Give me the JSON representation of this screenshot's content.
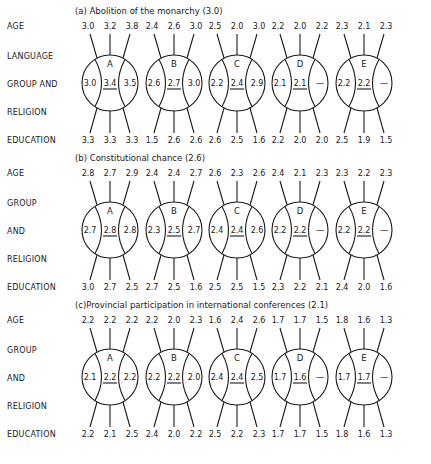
{
  "figure": {
    "row_labels": [
      "AGE",
      "LANGUAGE GROUP AND RELIGION",
      "EDUCATION"
    ],
    "panels": [
      {
        "title": "(a) Abolition of the monarchy (3.0)",
        "side_labels": [
          "AGE",
          "LANGUAGE",
          "GROUP  AND",
          "RELIGION",
          "EDUCATION"
        ],
        "groups": [
          {
            "name": "A",
            "age": [
              "3.0",
              "3.2",
              "3.8"
            ],
            "left": "3.0",
            "center": "3.4",
            "right": "3.5",
            "education": [
              "3.3",
              "3.3",
              "3.3"
            ]
          },
          {
            "name": "B",
            "age": [
              "2.4",
              "2.6",
              "3.0"
            ],
            "left": "2.6",
            "center": "2.7",
            "right": "3.0",
            "education": [
              "1.5",
              "2.6",
              "2.6"
            ]
          },
          {
            "name": "C",
            "age": [
              "2.5",
              "2.0",
              "3.0"
            ],
            "left": "2.2",
            "center": "2.4",
            "right": "2.9",
            "education": [
              "2.6",
              "2.5",
              "1.6"
            ]
          },
          {
            "name": "D",
            "age": [
              "2.2",
              "2.0",
              "2.2"
            ],
            "left": "2.1",
            "center": "2.1",
            "right": "—",
            "education": [
              "2.2",
              "2.0",
              "2.0"
            ]
          },
          {
            "name": "E",
            "age": [
              "2.3",
              "2.1",
              "2.3"
            ],
            "left": "2.2",
            "center": "2.2",
            "right": "—",
            "education": [
              "2.5",
              "1.9",
              "1.5"
            ]
          }
        ]
      },
      {
        "title": "(b) Constitutional chance (2.6)",
        "side_labels": [
          "AGE",
          "GROUP",
          "AND",
          "RELIGION",
          "EDUCATION"
        ],
        "groups": [
          {
            "name": "A",
            "age": [
              "2.8",
              "2.7",
              "2.9"
            ],
            "left": "2.7",
            "center": "2.8",
            "right": "2.8",
            "education": [
              "3.0",
              "2.7",
              "2.5"
            ]
          },
          {
            "name": "B",
            "age": [
              "2.4",
              "2.4",
              "2.7"
            ],
            "left": "2.3",
            "center": "2.5",
            "right": "2.7",
            "education": [
              "2.7",
              "2.5",
              "1.6"
            ]
          },
          {
            "name": "C",
            "age": [
              "2.6",
              "2.3",
              "2.6"
            ],
            "left": "2.4",
            "center": "2.4",
            "right": "2.6",
            "education": [
              "2.5",
              "2.5",
              "1.5"
            ]
          },
          {
            "name": "D",
            "age": [
              "2.4",
              "2.1",
              "2.3"
            ],
            "left": "2.2",
            "center": "2.2",
            "right": "—",
            "education": [
              "2.3",
              "2.2",
              "2.1"
            ]
          },
          {
            "name": "E",
            "age": [
              "2.3",
              "2.2",
              "2.3"
            ],
            "left": "2.2",
            "center": "2.2",
            "right": "—",
            "education": [
              "2.4",
              "2.0",
              "1.6"
            ]
          }
        ]
      },
      {
        "title": "(c)Provincial participation in international conferences (2.1)",
        "side_labels": [
          "AGE",
          "GROUP",
          "AND",
          "RELIGION",
          "EDUCATION"
        ],
        "groups": [
          {
            "name": "A",
            "age": [
              "2.2",
              "2.2",
              "2.2"
            ],
            "left": "2.1",
            "center": "2.2",
            "right": "2.2",
            "education": [
              "2.2",
              "2.1",
              "2.5"
            ]
          },
          {
            "name": "B",
            "age": [
              "2.2",
              "2.0",
              "2.3"
            ],
            "left": "2.2",
            "center": "2.2",
            "right": "2.0",
            "education": [
              "2.4",
              "2.0",
              "2.2"
            ]
          },
          {
            "name": "C",
            "age": [
              "1.6",
              "2.4",
              "2.6"
            ],
            "left": "2.4",
            "center": "2.4",
            "right": "2.5",
            "education": [
              "2.5",
              "2.2",
              "2.3"
            ]
          },
          {
            "name": "D",
            "age": [
              "1.7",
              "1.7",
              "1.5"
            ],
            "left": "1.7",
            "center": "1.6",
            "right": "—",
            "education": [
              "1.7",
              "1.7",
              "1.5"
            ]
          },
          {
            "name": "E",
            "age": [
              "1.8",
              "1.6",
              "1.3"
            ],
            "left": "1.7",
            "center": "1.7",
            "right": "—",
            "education": [
              "1.8",
              "1.6",
              "1.3"
            ]
          }
        ]
      }
    ]
  }
}
